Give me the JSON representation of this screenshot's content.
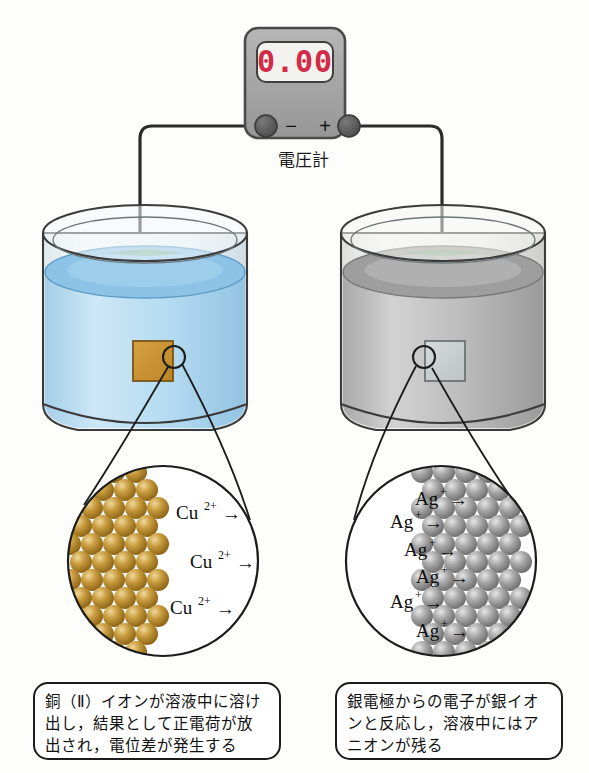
{
  "figure": {
    "background_color": "#fdfdfc"
  },
  "voltmeter": {
    "name": "電圧計",
    "display_value": "0.00",
    "display_color": "#d22c49",
    "display_bg": "#f2f2ee",
    "body_color": "#a8a8a8",
    "terminals": [
      {
        "id": "negative",
        "sign": "−",
        "label": "negative-terminal"
      },
      {
        "id": "positive",
        "sign": "+",
        "label": "positive-terminal"
      }
    ]
  },
  "beakers": [
    {
      "id": "left",
      "side": "left",
      "solution_color": "#b4daf0",
      "solution_surface_color": "#8cc3e6",
      "glass_color": "#eef3f5",
      "electrode": {
        "id": "copper-electrode",
        "material": "Cu",
        "color": "#c8922f",
        "border_color": "#7a5516"
      }
    },
    {
      "id": "right",
      "side": "right",
      "solution_color": "#b8b8b8",
      "solution_surface_color": "#9e9e9e",
      "glass_color": "#eef0f0",
      "electrode": {
        "id": "silver-electrode",
        "material": "Ag",
        "color": "#c9ced1",
        "border_color": "#6d7375"
      }
    }
  ],
  "magnifiers": [
    {
      "id": "left-magnifier",
      "metal": "Cu",
      "atom_color": "#b98a2e",
      "atom_highlight": "#e8c978",
      "metal_side": "left",
      "ion_labels": [
        {
          "symbol": "Cu",
          "charge": "2+",
          "arrow": "→"
        },
        {
          "symbol": "Cu",
          "charge": "2+",
          "arrow": "→"
        },
        {
          "symbol": "Cu",
          "charge": "2+",
          "arrow": "→"
        }
      ]
    },
    {
      "id": "right-magnifier",
      "metal": "Ag",
      "atom_color": "#9a9a9a",
      "atom_highlight": "#d8d8d8",
      "metal_side": "right",
      "ion_labels": [
        {
          "symbol": "Ag",
          "charge": "+",
          "arrow": "→"
        },
        {
          "symbol": "Ag",
          "charge": "+",
          "arrow": "→"
        },
        {
          "symbol": "Ag",
          "charge": "+",
          "arrow": "→"
        },
        {
          "symbol": "Ag",
          "charge": "+",
          "arrow": "→"
        },
        {
          "symbol": "Ag",
          "charge": "+",
          "arrow": "→"
        },
        {
          "symbol": "Ag",
          "charge": "+",
          "arrow": "→"
        }
      ]
    }
  ],
  "captions": [
    {
      "id": "left-caption",
      "lines": [
        "銅（Ⅱ）イオンが溶液中に溶け",
        "出し，結果として正電荷が放",
        "出され，電位差が発生する"
      ]
    },
    {
      "id": "right-caption",
      "lines": [
        "銀電極からの電子が銀イオ",
        "ンと反応し，溶液中にはア",
        "ニオンが残る"
      ]
    }
  ]
}
